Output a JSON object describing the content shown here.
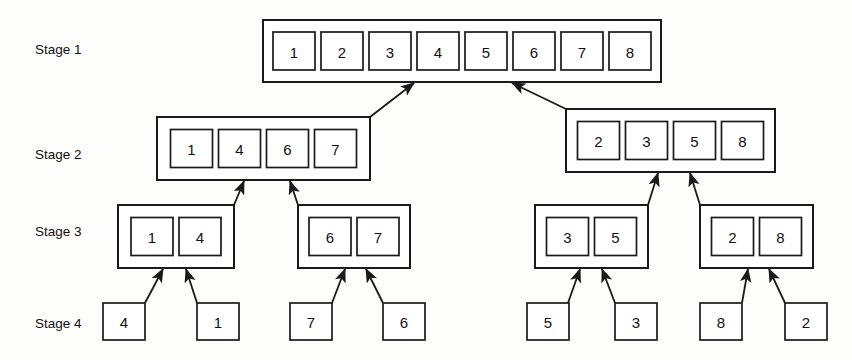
{
  "figure": {
    "background_color": "#fdfdfc",
    "line_color": "#1a1a1a",
    "box_fill": "#ffffff"
  },
  "stage_labels": [
    {
      "id": "stage-1",
      "text": "Stage 1",
      "x": 35,
      "y": 50
    },
    {
      "id": "stage-2",
      "text": "Stage 2",
      "x": 35,
      "y": 155
    },
    {
      "id": "stage-3",
      "text": "Stage 3",
      "x": 35,
      "y": 232
    },
    {
      "id": "stage-4",
      "text": "Stage 4",
      "x": 35,
      "y": 324
    }
  ],
  "groups": [
    {
      "id": "stage1-merged",
      "stage": 1,
      "x": 263,
      "y": 20,
      "width": 398,
      "height": 62,
      "cell_width": 42,
      "cell_height": 38,
      "cell_gap": 6,
      "inner_pad_x": 13,
      "inner_pad_y": 12,
      "values": [
        "1",
        "2",
        "3",
        "4",
        "5",
        "6",
        "7",
        "8"
      ]
    },
    {
      "id": "stage2-left",
      "stage": 2,
      "x": 157,
      "y": 117,
      "width": 213,
      "height": 63,
      "cell_width": 42,
      "cell_height": 38,
      "cell_gap": 6,
      "inner_pad_x": 15,
      "inner_pad_y": 12,
      "values": [
        "1",
        "4",
        "6",
        "7"
      ]
    },
    {
      "id": "stage2-right",
      "stage": 2,
      "x": 566,
      "y": 109,
      "width": 209,
      "height": 63,
      "cell_width": 42,
      "cell_height": 38,
      "cell_gap": 6,
      "inner_pad_x": 13,
      "inner_pad_y": 12,
      "values": [
        "2",
        "3",
        "5",
        "8"
      ]
    },
    {
      "id": "stage3-a",
      "stage": 3,
      "x": 118,
      "y": 205,
      "width": 116,
      "height": 63,
      "cell_width": 42,
      "cell_height": 38,
      "cell_gap": 6,
      "inner_pad_x": 13,
      "inner_pad_y": 12,
      "values": [
        "1",
        "4"
      ]
    },
    {
      "id": "stage3-b",
      "stage": 3,
      "x": 298,
      "y": 205,
      "width": 112,
      "height": 63,
      "cell_width": 42,
      "cell_height": 38,
      "cell_gap": 6,
      "inner_pad_x": 11,
      "inner_pad_y": 12,
      "values": [
        "6",
        "7"
      ]
    },
    {
      "id": "stage3-c",
      "stage": 3,
      "x": 535,
      "y": 205,
      "width": 113,
      "height": 63,
      "cell_width": 42,
      "cell_height": 38,
      "cell_gap": 6,
      "inner_pad_x": 11,
      "inner_pad_y": 12,
      "values": [
        "3",
        "5"
      ]
    },
    {
      "id": "stage3-d",
      "stage": 3,
      "x": 700,
      "y": 205,
      "width": 113,
      "height": 63,
      "cell_width": 42,
      "cell_height": 38,
      "cell_gap": 6,
      "inner_pad_x": 11,
      "inner_pad_y": 12,
      "values": [
        "2",
        "8"
      ]
    }
  ],
  "leaves": [
    {
      "id": "leaf-4",
      "stage": 4,
      "value": "4",
      "x": 103,
      "y": 303,
      "width": 42,
      "height": 37
    },
    {
      "id": "leaf-1",
      "stage": 4,
      "value": "1",
      "x": 197,
      "y": 303,
      "width": 42,
      "height": 37
    },
    {
      "id": "leaf-7",
      "stage": 4,
      "value": "7",
      "x": 290,
      "y": 303,
      "width": 42,
      "height": 37
    },
    {
      "id": "leaf-6",
      "stage": 4,
      "value": "6",
      "x": 383,
      "y": 303,
      "width": 42,
      "height": 37
    },
    {
      "id": "leaf-5",
      "stage": 4,
      "value": "5",
      "x": 527,
      "y": 303,
      "width": 42,
      "height": 37
    },
    {
      "id": "leaf-3b",
      "stage": 4,
      "value": "3",
      "x": 615,
      "y": 303,
      "width": 42,
      "height": 37
    },
    {
      "id": "leaf-8",
      "stage": 4,
      "value": "8",
      "x": 700,
      "y": 303,
      "width": 42,
      "height": 37
    },
    {
      "id": "leaf-2",
      "stage": 4,
      "value": "2",
      "x": 785,
      "y": 303,
      "width": 42,
      "height": 37
    }
  ],
  "arrows": [
    {
      "id": "arrow-s2left-to-s1",
      "from": "stage2-left",
      "to": "stage1-merged",
      "x1": 370,
      "y1": 117,
      "x2": 414,
      "y2": 83
    },
    {
      "id": "arrow-s2right-to-s1",
      "from": "stage2-right",
      "to": "stage1-merged",
      "x1": 566,
      "y1": 109,
      "x2": 512,
      "y2": 83
    },
    {
      "id": "arrow-s3a-to-s2left",
      "from": "stage3-a",
      "to": "stage2-left",
      "x1": 234,
      "y1": 205,
      "x2": 244,
      "y2": 181
    },
    {
      "id": "arrow-s3b-to-s2left",
      "from": "stage3-b",
      "to": "stage2-left",
      "x1": 298,
      "y1": 205,
      "x2": 290,
      "y2": 181
    },
    {
      "id": "arrow-s3c-to-s2right",
      "from": "stage3-c",
      "to": "stage2-right",
      "x1": 648,
      "y1": 205,
      "x2": 658,
      "y2": 173
    },
    {
      "id": "arrow-s3d-to-s2right",
      "from": "stage3-d",
      "to": "stage2-right",
      "x1": 700,
      "y1": 205,
      "x2": 690,
      "y2": 173
    },
    {
      "id": "arrow-leaf4-to-s3a",
      "from": "leaf-4",
      "to": "stage3-a",
      "x1": 145,
      "y1": 303,
      "x2": 163,
      "y2": 269
    },
    {
      "id": "arrow-leaf1-to-s3a",
      "from": "leaf-1",
      "to": "stage3-a",
      "x1": 197,
      "y1": 303,
      "x2": 186,
      "y2": 269
    },
    {
      "id": "arrow-leaf7-to-s3b",
      "from": "leaf-7",
      "to": "stage3-b",
      "x1": 332,
      "y1": 303,
      "x2": 345,
      "y2": 269
    },
    {
      "id": "arrow-leaf6-to-s3b",
      "from": "leaf-6",
      "to": "stage3-b",
      "x1": 383,
      "y1": 303,
      "x2": 366,
      "y2": 269
    },
    {
      "id": "arrow-leaf5-to-s3c",
      "from": "leaf-5",
      "to": "stage3-c",
      "x1": 568,
      "y1": 303,
      "x2": 580,
      "y2": 269
    },
    {
      "id": "arrow-leaf3-to-s3c",
      "from": "leaf-3b",
      "to": "stage3-c",
      "x1": 615,
      "y1": 303,
      "x2": 602,
      "y2": 269
    },
    {
      "id": "arrow-leaf8-to-s3d",
      "from": "leaf-8",
      "to": "stage3-d",
      "x1": 742,
      "y1": 303,
      "x2": 748,
      "y2": 269
    },
    {
      "id": "arrow-leaf2-to-s3d",
      "from": "leaf-2",
      "to": "stage3-d",
      "x1": 785,
      "y1": 303,
      "x2": 769,
      "y2": 269
    }
  ]
}
